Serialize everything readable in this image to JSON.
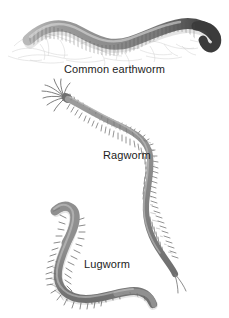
{
  "plate": {
    "type": "natural-history-illustration",
    "subject": "annelid worms",
    "background_color": "#ffffff",
    "width": 229,
    "height": 318,
    "text_color": "#1c1c1c"
  },
  "labels": {
    "earthworm": "Common earthworm",
    "ragworm": "Ragworm",
    "lugworm": "Lugworm"
  },
  "specimens": [
    {
      "name": "Common earthworm",
      "icon": "earthworm-icon",
      "position": "top",
      "body_color": "#8a8a8a",
      "dark_end_color": "#3a3a3a",
      "shape": "sinuous-s-curve-horizontal",
      "features": [
        "segmented-rings",
        "dark-tapered-posterior",
        "faint-soil-sketch-background"
      ]
    },
    {
      "name": "Ragworm",
      "icon": "ragworm-icon",
      "position": "middle",
      "body_color": "#8e8e8e",
      "shape": "s-curve-descending",
      "features": [
        "head-tentacles",
        "bristled-parapodia-both-sides",
        "forked-tail-cirri"
      ]
    },
    {
      "name": "Lugworm",
      "icon": "lugworm-icon",
      "position": "bottom",
      "body_color": "#8b8b8b",
      "shape": "hooked-s-curve",
      "features": [
        "thick-smooth-anterior",
        "gill-tufts-midbody",
        "smooth-tapering-tail"
      ]
    }
  ]
}
